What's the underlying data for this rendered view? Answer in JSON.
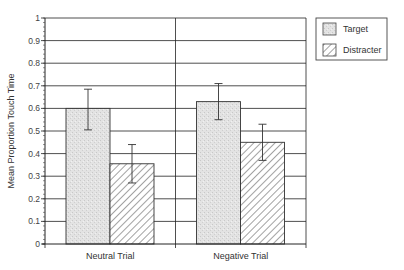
{
  "chart_data": {
    "type": "bar",
    "title": "",
    "xlabel": "",
    "ylabel": "Mean Proportion Touch Time",
    "ylim": [
      0,
      1
    ],
    "yticks": [
      0,
      0.1,
      0.2,
      0.3,
      0.4,
      0.5,
      0.6,
      0.7,
      0.8,
      0.9,
      1
    ],
    "ytick_labels": [
      "0",
      "0.1",
      "0.2",
      "0.3",
      "0.4",
      "0.5",
      "0.6",
      "0.7",
      "0.8",
      "0.9",
      "1"
    ],
    "grid": true,
    "legend_position": "right-top",
    "categories": [
      "Neutral Trial",
      "Negative Trial"
    ],
    "series": [
      {
        "name": "Target",
        "pattern": "stipple",
        "color": "#d9d9d9",
        "values": [
          0.6,
          0.63
        ],
        "error_low": [
          0.505,
          0.55
        ],
        "error_high": [
          0.685,
          0.71
        ]
      },
      {
        "name": "Distracter",
        "pattern": "diagonal-hatch",
        "color": "#ffffff",
        "values": [
          0.355,
          0.45
        ],
        "error_low": [
          0.27,
          0.37
        ],
        "error_high": [
          0.44,
          0.53
        ]
      }
    ]
  }
}
